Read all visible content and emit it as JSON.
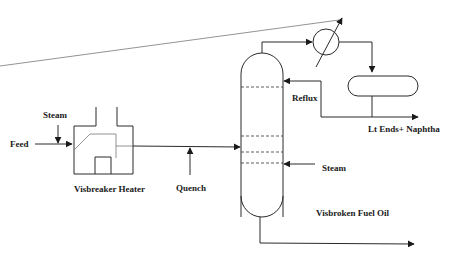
{
  "diagram": {
    "labels": {
      "steam_heater": "Steam",
      "feed": "Feed",
      "heater": "Visbreaker Heater",
      "quench": "Quench",
      "reflux": "Reflux",
      "overhead_product": "Lt Ends+ Naphtha",
      "steam_column": "Steam",
      "bottoms_product": "Visbroken Fuel Oil"
    },
    "colors": {
      "line": "#2a2a2a",
      "background": "#ffffff"
    }
  }
}
